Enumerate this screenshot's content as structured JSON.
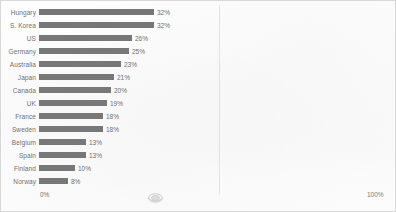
{
  "chart_data": {
    "type": "bar",
    "orientation": "horizontal",
    "title": "",
    "xlabel": "",
    "ylabel": "",
    "categories": [
      "Hungary",
      "S. Korea",
      "US",
      "Germany",
      "Australia",
      "Japan",
      "Canada",
      "UK",
      "France",
      "Sweden",
      "Belgium",
      "Spain",
      "Finland",
      "Norway"
    ],
    "values": [
      32,
      32,
      26,
      25,
      23,
      21,
      20,
      19,
      18,
      18,
      13,
      13,
      10,
      8
    ],
    "value_labels": [
      "32%",
      "32%",
      "26%",
      "25%",
      "23%",
      "21%",
      "20%",
      "19%",
      "18%",
      "18%",
      "13%",
      "13%",
      "10%",
      "8%"
    ],
    "xlim": [
      0,
      100
    ],
    "axis_tick_labels": [
      "0%",
      "100%"
    ],
    "grid": true,
    "gridline_positions": [
      50
    ],
    "legend": "none",
    "bar_color": "#767676",
    "text_color": "#6e6e6e",
    "background_color": "#fefefe"
  },
  "axis": {
    "min_label": "0%",
    "max_label": "100%"
  },
  "artifacts": {
    "stamp": "oval-stamp-icon"
  }
}
